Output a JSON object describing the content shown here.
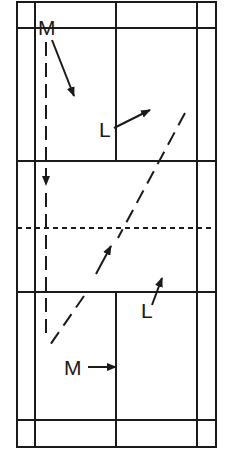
{
  "diagram": {
    "type": "badminton-court-doubles-movement",
    "colors": {
      "line": "#1a1a1a",
      "background": "#ffffff"
    },
    "labels": {
      "top_m": "M",
      "top_l": "L",
      "bottom_l": "L",
      "bottom_m": "M"
    }
  }
}
